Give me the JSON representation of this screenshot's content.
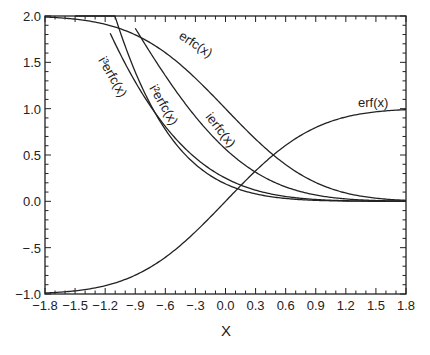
{
  "chart_data": {
    "type": "line",
    "title": "",
    "xlabel": "X",
    "ylabel": "",
    "xlim": [
      -1.8,
      1.8
    ],
    "ylim": [
      -1.0,
      2.0
    ],
    "grid": false,
    "legend": "inline curve labels",
    "x_ticks": [
      -1.8,
      -1.5,
      -1.2,
      -0.9,
      -0.6,
      -0.3,
      0.0,
      0.3,
      0.6,
      0.9,
      1.2,
      1.5,
      1.8
    ],
    "x_tick_labels": [
      "−1.8",
      "−1.5",
      "−1.2",
      "−.9",
      "−.6",
      "−.3",
      "0.0",
      "0.3",
      "0.6",
      "0.9",
      "1.2",
      "1.5",
      "1.8"
    ],
    "y_ticks": [
      2.0,
      1.5,
      1.0,
      0.5,
      0.0,
      -0.5,
      -1.0
    ],
    "y_tick_labels": [
      "2.0",
      "1.5",
      "1.0",
      "0.5",
      "0.0",
      "−.5",
      "−1.0"
    ],
    "x": [
      -1.8,
      -1.5,
      -1.2,
      -0.9,
      -0.6,
      -0.3,
      0.0,
      0.3,
      0.6,
      0.9,
      1.2,
      1.5,
      1.8
    ],
    "series": [
      {
        "name": "erf(x)",
        "label": "erf(x)",
        "start": -1.8,
        "values": [
          -0.989,
          -0.966,
          -0.91,
          -0.797,
          -0.604,
          -0.329,
          0.0,
          0.329,
          0.604,
          0.797,
          0.91,
          0.966,
          0.989
        ]
      },
      {
        "name": "erfc(x)",
        "label": "erfc(x)",
        "start": -1.8,
        "values": [
          1.989,
          1.966,
          1.91,
          1.797,
          1.604,
          1.329,
          1.0,
          0.671,
          0.396,
          0.203,
          0.09,
          0.034,
          0.011
        ]
      },
      {
        "name": "ierfc(x)",
        "label": "ierfc(x)",
        "start": -0.9,
        "values": [
          null,
          null,
          null,
          1.868,
          1.36,
          0.912,
          0.564,
          0.318,
          0.159,
          0.07,
          0.026,
          0.009,
          0.002
        ]
      },
      {
        "name": "i2erfc(x)",
        "label": "i²erfc(x)",
        "start": -1.15,
        "values": [
          null,
          null,
          1.933,
          1.369,
          0.9,
          0.534,
          0.25,
          0.119,
          0.051,
          0.019,
          0.006,
          0.002,
          0.0
        ]
      },
      {
        "name": "i3erfc(x)",
        "label": "i³erfc(x)",
        "start": -1.5,
        "values": [
          null,
          1.867,
          1.211,
          0.739,
          0.417,
          0.21,
          0.094,
          0.037,
          0.013,
          0.004,
          0.001,
          0.0,
          0.0
        ]
      }
    ]
  },
  "labels": {
    "xlabel": "X",
    "erf": "erf(x)",
    "erfc": "erfc(x)",
    "ierfc": "ierfc(x)",
    "i2erfc": "i²erfc(x)",
    "i3erfc": "i³erfc(x)"
  },
  "colors": {
    "line": "#222222",
    "axis": "#222222",
    "background": "#ffffff"
  }
}
